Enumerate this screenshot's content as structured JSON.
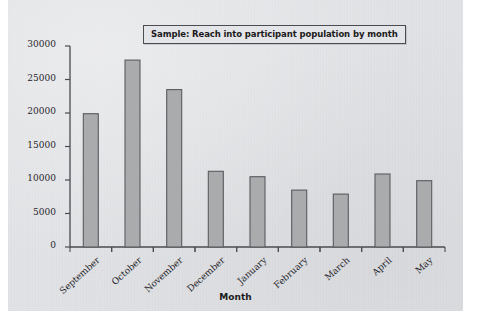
{
  "chart_data": {
    "type": "bar",
    "title": "Sample: Reach into participant population by month",
    "xlabel": "Month",
    "ylabel": "",
    "categories": [
      "September",
      "October",
      "November",
      "December",
      "January",
      "February",
      "March",
      "April",
      "May"
    ],
    "values": [
      19900,
      27900,
      23500,
      11300,
      10500,
      8500,
      7900,
      10900,
      9900
    ],
    "ylim": [
      0,
      30000
    ],
    "ytick_step": 5000,
    "yticks": [
      "0",
      "5000",
      "10000",
      "15000",
      "20000",
      "25000",
      "30000"
    ],
    "grid": false,
    "legend": "none",
    "bar_fill": "#a9abad",
    "bar_stroke": "#5a5b60",
    "axis_color": "#4a4b50",
    "plot_background": "#e2e3e6",
    "xtick_label_rotation": -42
  }
}
